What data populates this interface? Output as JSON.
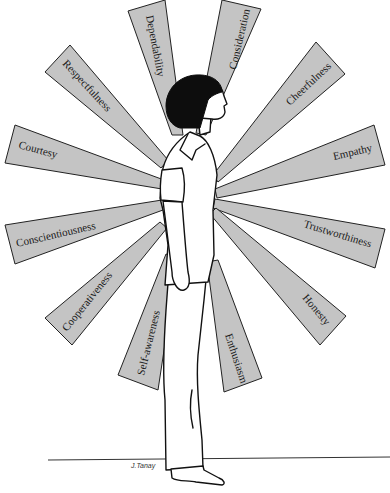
{
  "figure": {
    "signature": "J.Tanay",
    "colors": {
      "ray_fill": "#c4c4c4",
      "outline": "#222222",
      "hair": "#0d0d0d",
      "background": "#ffffff"
    }
  },
  "traits": [
    {
      "label": "Dependability"
    },
    {
      "label": "Consideration"
    },
    {
      "label": "Respectfulness"
    },
    {
      "label": "Cheerfulness"
    },
    {
      "label": "Courtesy"
    },
    {
      "label": "Empathy"
    },
    {
      "label": "Conscientiousness"
    },
    {
      "label": "Trustworthiness"
    },
    {
      "label": "Cooperativeness"
    },
    {
      "label": "Honesty"
    },
    {
      "label": "Self-awareness"
    },
    {
      "label": "Enthusiasm"
    }
  ]
}
